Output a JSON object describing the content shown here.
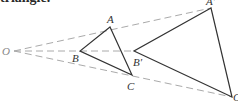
{
  "heading": "triangle.",
  "diagram": {
    "type": "dilation",
    "center": {
      "label": "O",
      "x": 14,
      "y": 51,
      "label_x": 2,
      "label_y": 55
    },
    "original_triangle": {
      "A": {
        "label": "A",
        "x": 110,
        "y": 27,
        "label_x": 107,
        "label_y": 23
      },
      "B": {
        "label": "B",
        "x": 80,
        "y": 51,
        "label_x": 72,
        "label_y": 62
      },
      "C": {
        "label": "C",
        "x": 132,
        "y": 75,
        "label_x": 127,
        "label_y": 90
      }
    },
    "image_triangle": {
      "A_prime": {
        "label": "A′",
        "x": 211,
        "y": 8,
        "label_x": 206,
        "label_y": 5
      },
      "B_prime": {
        "label": "B′",
        "x": 134,
        "y": 51,
        "label_x": 133,
        "label_y": 66
      },
      "C_prime": {
        "label": "C′",
        "x": 232,
        "y": 97,
        "label_x": 233,
        "label_y": 101
      }
    },
    "colors": {
      "triangle_stroke": "#333333",
      "ray_stroke": "#aaaaaa",
      "center_label": "#888888"
    }
  }
}
